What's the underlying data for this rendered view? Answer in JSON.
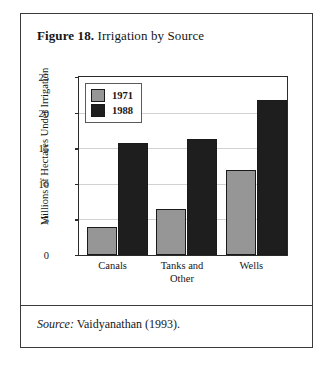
{
  "figure": {
    "number_label": "Figure 18.",
    "title": "Irrigation by Source",
    "source_word": "Source:",
    "source_text": "Vaidyanathan (1993)."
  },
  "chart_data": {
    "type": "bar",
    "title": "Irrigation by Source",
    "xlabel": "",
    "ylabel": "Millions of Hectares Under Irrigation",
    "categories": [
      "Canals",
      "Tanks and Other",
      "Wells"
    ],
    "category_lines": [
      [
        "Canals"
      ],
      [
        "Tanks and",
        "Other"
      ],
      [
        "Wells"
      ]
    ],
    "series": [
      {
        "name": "1971",
        "color": "#969696",
        "values": [
          4.0,
          6.5,
          12.0
        ]
      },
      {
        "name": "1988",
        "color": "#1e1e1e",
        "values": [
          15.7,
          16.3,
          21.8
        ]
      }
    ],
    "ylim": [
      0,
      25
    ],
    "yticks": [
      0,
      5,
      10,
      15,
      20,
      25
    ],
    "ytick_labels": [
      "0",
      "5",
      "10",
      "15",
      "20",
      "25"
    ],
    "grid": true,
    "legend_position": "top-left"
  },
  "colors": {
    "frame": "#3a3a3a",
    "axis": "#2b2b2b",
    "grid": "#d2d2d2",
    "text": "#161616",
    "series_1971": "#969696",
    "series_1988": "#1e1e1e"
  }
}
